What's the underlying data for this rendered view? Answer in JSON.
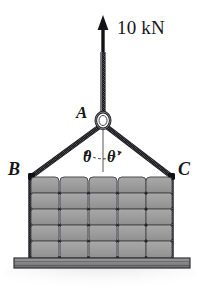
{
  "figure": {
    "background_color": "#ffffff",
    "width": 200,
    "height": 296,
    "labels": {
      "force": "10 kN",
      "node_a": "A",
      "node_b": "B",
      "node_c": "C",
      "angle_left": "θ",
      "angle_right": "θ"
    },
    "colors": {
      "ink": "#16161a",
      "rope": "#3a3a3e",
      "rope_highlight": "#b9b9bd",
      "brick_fill": "#9d9d9d",
      "brick_edge": "#4c4c50",
      "pallet_fill": "#8d8d8d",
      "pallet_edge": "#2f2f33",
      "ground_shadow": "#e6e6e6"
    },
    "geometry": {
      "arrow_tip_x": 103,
      "arrow_tip_y": 17,
      "ring_center_x": 103,
      "ring_center_y": 121,
      "point_b_x": 31,
      "point_b_y": 176,
      "point_c_x": 172,
      "point_c_y": 176,
      "stack_columns": 5,
      "stack_rows": 5,
      "stack_left": 30,
      "stack_right": 172,
      "stack_top": 177,
      "stack_bottom": 258,
      "pallet_left": 14,
      "pallet_right": 190,
      "pallet_top": 258,
      "pallet_bottom": 268
    }
  }
}
